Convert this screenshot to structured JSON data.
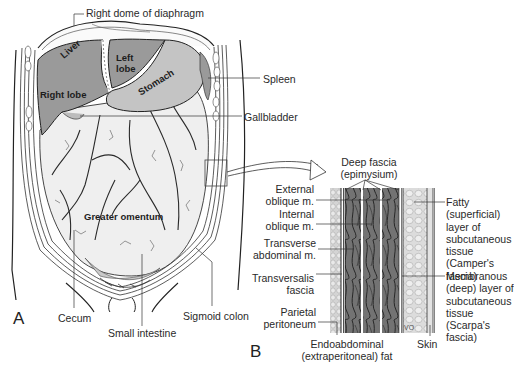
{
  "figure": {
    "panel_a": {
      "letter": "A",
      "organ_labels": {
        "liver": "Liver",
        "right_lobe": "Right lobe",
        "left_lobe_1": "Left",
        "left_lobe_2": "lobe",
        "stomach": "Stomach",
        "greater_omentum": "Greater omentum"
      },
      "callouts": {
        "diaphragm": "Right dome of diaphragm",
        "spleen": "Spleen",
        "gallbladder": "Gallbladder",
        "cecum": "Cecum",
        "small_intestine": "Small intestine",
        "sigmoid_colon": "Sigmoid colon"
      }
    },
    "panel_b": {
      "letter": "B",
      "left_labels": [
        {
          "l1": "External",
          "l2": "oblique m."
        },
        {
          "l1": "Internal",
          "l2": "oblique m."
        },
        {
          "l1": "Transverse",
          "l2": "abdominal m."
        },
        {
          "l1": "Transversalis",
          "l2": "fascia"
        },
        {
          "l1": "Parietal",
          "l2": "peritoneum"
        }
      ],
      "top_label": {
        "l1": "Deep fascia",
        "l2": "(epimysium)"
      },
      "right_labels": [
        {
          "lines": [
            "Fatty",
            "(superficial)",
            "layer of",
            "subcutaneous",
            "tissue",
            "(Camper's",
            "fascia)"
          ]
        },
        {
          "lines": [
            "Membranous",
            "(deep) layer of",
            "subcutaneous",
            "tissue",
            "(Scarpa's",
            "fascia)"
          ]
        }
      ],
      "bottom_labels": {
        "endo_l1": "Endoabdominal",
        "endo_l2": "(extraperitoneal) fat",
        "skin": "Skin"
      },
      "signature": "VO"
    },
    "colors": {
      "liver": "#9a9a9a",
      "stomach": "#c4c4c4",
      "omentum": "#ececec",
      "muscle": "#6e6e6e",
      "fat": "#d8d8d8",
      "line": "#2a2a2a"
    }
  }
}
